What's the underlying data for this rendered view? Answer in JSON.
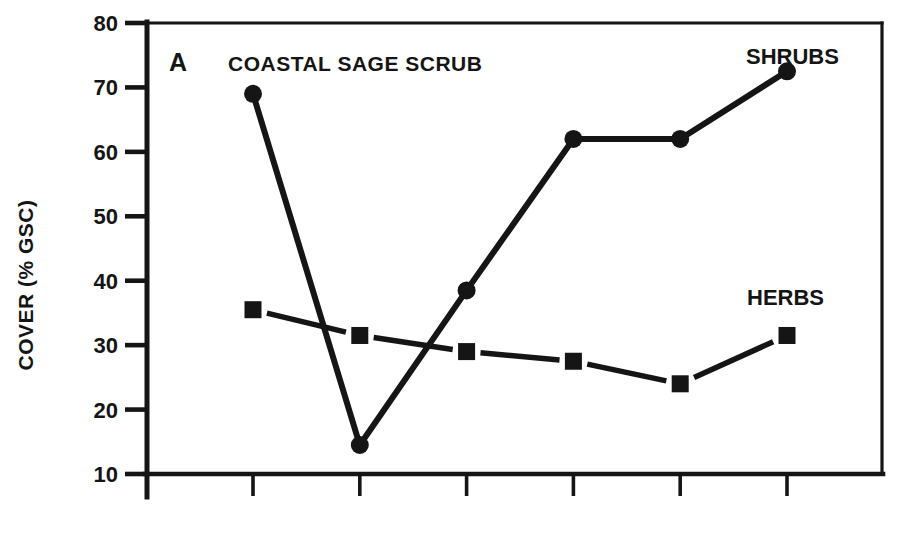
{
  "figure": {
    "panel_label": "A",
    "background_color": "#ffffff",
    "ink_color": "#151515"
  },
  "chart_data": {
    "type": "line",
    "title": "COASTAL SAGE SCRUB",
    "panel": "A",
    "xlabel": "",
    "ylabel": "COVER (% GSC)",
    "ylim": [
      10,
      80
    ],
    "yticks": [
      10,
      20,
      30,
      40,
      50,
      60,
      70,
      80
    ],
    "x_tick_count": 6,
    "x_tick_labels": [
      "",
      "",
      "",
      "",
      "",
      ""
    ],
    "grid": false,
    "legend_position": "inline-labels",
    "series": [
      {
        "name": "SHRUBS",
        "marker": "circle",
        "line_style": "solid",
        "values": [
          69,
          14.5,
          38.5,
          62,
          62,
          72.5
        ]
      },
      {
        "name": "HERBS",
        "marker": "square",
        "line_style": "dashed",
        "values": [
          35.5,
          31.5,
          29,
          27.5,
          24,
          31.5
        ]
      }
    ]
  }
}
